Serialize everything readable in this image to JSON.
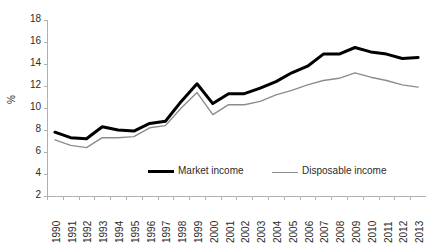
{
  "chart_data": {
    "type": "line",
    "title": "",
    "xlabel": "",
    "ylabel": "%",
    "ylim": [
      2,
      18
    ],
    "yticks": [
      2,
      4,
      6,
      8,
      10,
      12,
      14,
      16,
      18
    ],
    "grid": false,
    "legend_position": "inside-bottom-center",
    "categories": [
      "1990",
      "1991",
      "1992",
      "1993",
      "1994",
      "1995",
      "1996",
      "1997",
      "1998",
      "1999",
      "2000",
      "2001",
      "2002",
      "2003",
      "2004",
      "2005",
      "2006",
      "2007",
      "2008",
      "2009",
      "2010",
      "2011",
      "2012",
      "2013"
    ],
    "series": [
      {
        "name": "Market income",
        "color": "#000000",
        "width": 3,
        "values": [
          7.8,
          7.3,
          7.2,
          8.3,
          8.0,
          7.9,
          8.6,
          8.8,
          10.6,
          12.2,
          10.4,
          11.3,
          11.3,
          11.8,
          12.4,
          13.2,
          13.8,
          14.9,
          14.9,
          15.5,
          15.1,
          14.9,
          14.5,
          14.6
        ]
      },
      {
        "name": "Disposable income",
        "color": "#8c8c8c",
        "width": 1.4,
        "values": [
          7.1,
          6.6,
          6.4,
          7.3,
          7.3,
          7.4,
          8.2,
          8.4,
          10.0,
          11.4,
          9.4,
          10.3,
          10.3,
          10.6,
          11.2,
          11.6,
          12.1,
          12.5,
          12.7,
          13.2,
          12.8,
          12.5,
          12.1,
          11.9
        ]
      }
    ],
    "legend": [
      {
        "label": "Market income",
        "color": "#000000",
        "thickness": "thick"
      },
      {
        "label": "Disposable income",
        "color": "#8c8c8c",
        "thickness": "thin"
      }
    ]
  }
}
